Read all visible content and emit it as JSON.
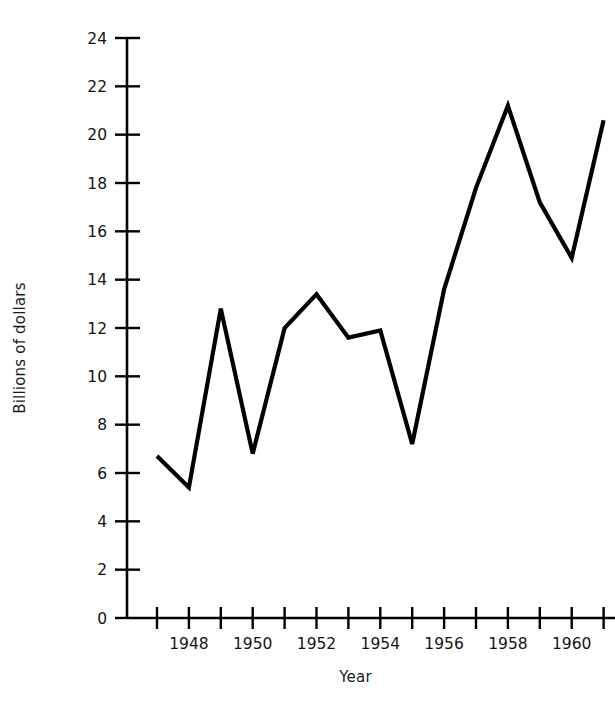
{
  "chart_data": {
    "type": "line",
    "title": "",
    "subtitle": "",
    "xlabel": "Year",
    "ylabel": "Billions of dollars",
    "xlim": [
      1946.5,
      1961.5
    ],
    "ylim": [
      0,
      24
    ],
    "grid": false,
    "legend": null,
    "annotations": [],
    "x": [
      1947,
      1948,
      1949,
      1950,
      1951,
      1952,
      1953,
      1954,
      1955,
      1956,
      1957,
      1958,
      1959,
      1960,
      1961
    ],
    "values": [
      6.7,
      5.4,
      12.8,
      6.8,
      12.0,
      13.4,
      11.6,
      11.9,
      7.2,
      13.6,
      17.8,
      21.2,
      17.2,
      14.9,
      20.6
    ],
    "series": [
      {
        "name": "Billions of dollars",
        "values": [
          6.7,
          5.4,
          12.8,
          6.8,
          12.0,
          13.4,
          11.6,
          11.9,
          7.2,
          13.6,
          17.8,
          21.2,
          17.2,
          14.9,
          20.6
        ],
        "color": "#000000"
      }
    ],
    "x_ticks": [
      1947,
      1948,
      1949,
      1950,
      1951,
      1952,
      1953,
      1954,
      1955,
      1956,
      1957,
      1958,
      1959,
      1960,
      1961
    ],
    "x_tick_labels": [
      "",
      "1948",
      "",
      "1950",
      "",
      "1952",
      "",
      "1954",
      "",
      "1956",
      "",
      "1958",
      "",
      "1960",
      ""
    ],
    "y_ticks": [
      0,
      2,
      4,
      6,
      8,
      10,
      12,
      14,
      16,
      18,
      20,
      22,
      24
    ],
    "y_tick_labels": [
      "0",
      "2",
      "4",
      "6",
      "8",
      "10",
      "12",
      "14",
      "16",
      "18",
      "20",
      "22",
      "24"
    ],
    "line_color": "#000000",
    "axis_color": "#000000",
    "background_color": "#ffffff"
  }
}
